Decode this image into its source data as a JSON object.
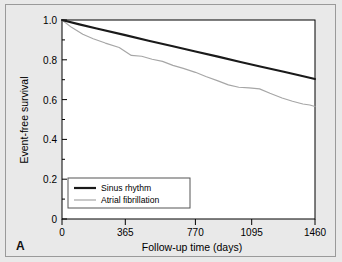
{
  "figure": {
    "panel_label": "A",
    "background_color": "#e9e9e9",
    "plot_background_color": "#ffffff",
    "border_color": "#9a9a9a"
  },
  "chart_data": {
    "type": "line",
    "title": "",
    "subtitle": "",
    "xlabel": "Follow-up time (days)",
    "ylabel": "Event-free survival",
    "xlim": [
      0,
      1460
    ],
    "ylim": [
      0,
      1.0
    ],
    "grid": false,
    "legend_position": "lower-left-inside",
    "x_ticks": [
      0,
      365,
      770,
      1095,
      1460
    ],
    "x_tick_labels": [
      "0",
      "365",
      "770",
      "1095",
      "1460"
    ],
    "x_minor_ticks": [
      182,
      567,
      932,
      1277
    ],
    "y_ticks": [
      0,
      0.2,
      0.4,
      0.6,
      0.8,
      1.0
    ],
    "y_tick_labels": [
      "0",
      "0.2",
      "0.4",
      "0.6",
      "0.8",
      "1.0"
    ],
    "y_minor_ticks": [
      0.1,
      0.3,
      0.5,
      0.7,
      0.9
    ],
    "series": [
      {
        "name": "Sinus rhythm",
        "color": "#1a1a1a",
        "line_width": 2.1,
        "x": [
          0,
          100,
          200,
          365,
          500,
          640,
          770,
          900,
          1030,
          1150,
          1280,
          1380,
          1460
        ],
        "values": [
          1.0,
          0.978,
          0.957,
          0.924,
          0.896,
          0.868,
          0.842,
          0.816,
          0.789,
          0.765,
          0.74,
          0.72,
          0.703
        ]
      },
      {
        "name": "Atrial fibrillation",
        "color": "#a6a6a6",
        "line_width": 1.15,
        "x": [
          0,
          55,
          120,
          180,
          250,
          330,
          400,
          460,
          520,
          580,
          640,
          700,
          770,
          830,
          900,
          960,
          1020,
          1080,
          1140,
          1200,
          1270,
          1330,
          1390,
          1430,
          1460
        ],
        "values": [
          1.0,
          0.963,
          0.928,
          0.906,
          0.884,
          0.862,
          0.822,
          0.818,
          0.803,
          0.792,
          0.772,
          0.757,
          0.737,
          0.716,
          0.694,
          0.674,
          0.662,
          0.659,
          0.654,
          0.632,
          0.608,
          0.592,
          0.578,
          0.573,
          0.565
        ]
      }
    ]
  },
  "legend": {
    "items": [
      {
        "label": "Sinus rhythm",
        "color": "#1a1a1a"
      },
      {
        "label": "Atrial fibrillation",
        "color": "#a6a6a6"
      }
    ]
  }
}
